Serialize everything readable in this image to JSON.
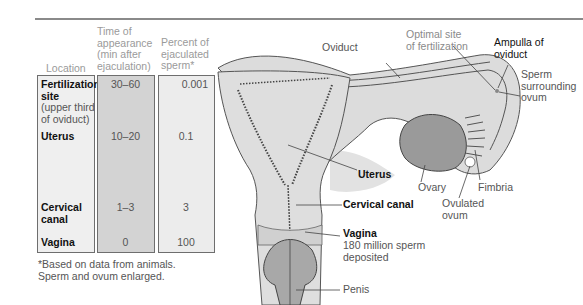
{
  "table": {
    "headers": {
      "location": "Location",
      "time": [
        "Time of",
        "appearance",
        "(min after",
        "ejaculation)"
      ],
      "percent": [
        "Percent of",
        "ejaculated",
        "sperm*"
      ]
    },
    "rows": [
      {
        "location": "Fertilization site",
        "location_sub": "(upper third of oviduct)",
        "time": "30–60",
        "percent": "0.001"
      },
      {
        "location": "Uterus",
        "location_sub": "",
        "time": "10–20",
        "percent": "0.1"
      },
      {
        "location": "Cervical canal",
        "location_sub": "",
        "time": "1–3",
        "percent": "3"
      },
      {
        "location": "Vagina",
        "location_sub": "",
        "time": "0",
        "percent": "100"
      }
    ],
    "footnote": [
      "*Based on data from animals.",
      "Sperm and ovum enlarged."
    ]
  },
  "labels": {
    "oviduct": "Oviduct",
    "optimal_site": [
      "Optimal site",
      "of fertilization"
    ],
    "ampulla": [
      "Ampulla of",
      "oviduct"
    ],
    "sperm_surrounding": [
      "Sperm",
      "surrounding",
      "ovum"
    ],
    "uterus": "Uterus",
    "ovary": "Ovary",
    "fimbria": "Fimbria",
    "ovulated_ovum": [
      "Ovulated",
      "ovum"
    ],
    "cervical_canal": "Cervical canal",
    "vagina": "Vagina",
    "vagina_sub": [
      "180 million sperm",
      "deposited"
    ],
    "penis": "Penis"
  },
  "colors": {
    "rule": "#8a8a8a",
    "tissue": "#d9d9d9",
    "tissue_light": "#e6e6e6",
    "ovary": "#9a9a9a",
    "penis": "#a8a8a8",
    "cell_dark": "#d3d3d3",
    "cell_light": "#efefef"
  }
}
